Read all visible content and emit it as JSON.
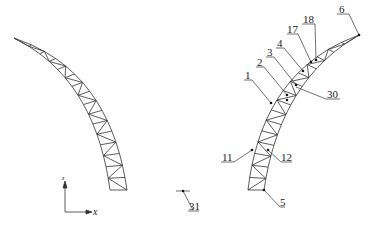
{
  "diagram": {
    "type": "truss-arch-finite-element-model",
    "colors": {
      "line": "#333333",
      "node": "#111111",
      "background": "#ffffff"
    },
    "axes": {
      "x_label": "x",
      "z_label": "z"
    },
    "left_truss": {
      "description": "curved truss arch (unlabeled view)"
    },
    "right_truss": {
      "description": "curved truss arch with numbered nodes"
    },
    "node_labels": [
      {
        "id": "6",
        "text": "6"
      },
      {
        "id": "18",
        "text": "18"
      },
      {
        "id": "17",
        "text": "17"
      },
      {
        "id": "4",
        "text": "4"
      },
      {
        "id": "3",
        "text": "3"
      },
      {
        "id": "2",
        "text": "2"
      },
      {
        "id": "1",
        "text": "1"
      },
      {
        "id": "30",
        "text": "30"
      },
      {
        "id": "11",
        "text": "11"
      },
      {
        "id": "12",
        "text": "12"
      },
      {
        "id": "5",
        "text": "5"
      },
      {
        "id": "31",
        "text": "31"
      }
    ]
  }
}
